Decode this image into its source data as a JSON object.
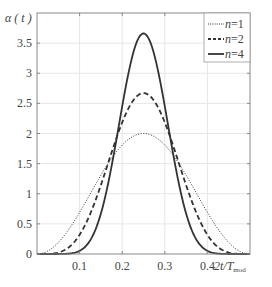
{
  "chart_data": {
    "type": "line",
    "title": "",
    "ylabel": "α ( t )",
    "xlabel": "2t/T_mod",
    "xlabel_main": "2t/T",
    "xlabel_sub": "mod",
    "xlim": [
      0,
      0.5
    ],
    "ylim": [
      0,
      4
    ],
    "grid": true,
    "legend_position": "upper right",
    "x_ticks": [
      0.1,
      0.2,
      0.3,
      0.4
    ],
    "x_tick_labels": [
      "0.1",
      "0.2",
      "0.3",
      "0.4"
    ],
    "y_ticks": [
      0,
      0.5,
      1,
      1.5,
      2,
      2.5,
      3,
      3.5
    ],
    "y_tick_labels": [
      "0",
      "0.5",
      "1",
      "1.5",
      "2",
      "2.5",
      "3",
      "3.5"
    ],
    "x": [
      0,
      0.025,
      0.05,
      0.075,
      0.1,
      0.125,
      0.15,
      0.175,
      0.2,
      0.225,
      0.25,
      0.275,
      0.3,
      0.325,
      0.35,
      0.375,
      0.4,
      0.425,
      0.45,
      0.475,
      0.5
    ],
    "series": [
      {
        "name": "n=1",
        "legend_label_italic": "n",
        "legend_label_rest": "=1",
        "style": "dotted",
        "peak": 2.0,
        "values": [
          0,
          0.049,
          0.191,
          0.412,
          0.691,
          1.0,
          1.309,
          1.588,
          1.809,
          1.951,
          2.0,
          1.951,
          1.809,
          1.588,
          1.309,
          1.0,
          0.691,
          0.412,
          0.191,
          0.049,
          0
        ]
      },
      {
        "name": "n=2",
        "legend_label_italic": "n",
        "legend_label_rest": "=2",
        "style": "dashed",
        "peak": 2.67,
        "values": [
          0,
          0.001,
          0.024,
          0.113,
          0.318,
          0.667,
          1.143,
          1.682,
          2.182,
          2.54,
          2.667,
          2.54,
          2.182,
          1.682,
          1.143,
          0.667,
          0.318,
          0.113,
          0.024,
          0.001,
          0
        ]
      },
      {
        "name": "n=4",
        "legend_label_italic": "n",
        "legend_label_rest": "=4",
        "style": "solid",
        "peak": 3.66,
        "values": [
          0,
          0.0,
          0.0,
          0.012,
          0.087,
          0.343,
          0.897,
          1.772,
          2.764,
          3.534,
          3.657,
          3.534,
          2.764,
          1.772,
          0.897,
          0.343,
          0.087,
          0.012,
          0.0,
          0.0,
          0
        ]
      }
    ]
  },
  "colors": {
    "curve": "#333333",
    "axis": "#888888",
    "grid": "#e6e6e6",
    "text": "#444444"
  }
}
